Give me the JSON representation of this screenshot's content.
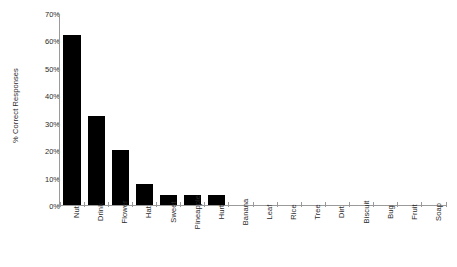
{
  "chart_data": {
    "type": "bar",
    "title": "",
    "subtitle": "",
    "xlabel": "",
    "ylabel": "% Correct Responses",
    "ylim": [
      0,
      70
    ],
    "ytick_labels": [
      "0%",
      "10%",
      "20%",
      "30%",
      "40%",
      "50%",
      "60%",
      "70%"
    ],
    "ytick_values": [
      0,
      10,
      20,
      30,
      40,
      50,
      60,
      70
    ],
    "grid": false,
    "legend": null,
    "bar_color": "#000000",
    "axis_color": "#9a9a9a",
    "background_color": "#ffffff",
    "categories": [
      "Nut",
      "Drink",
      "Flower",
      "Hat",
      "Sweet",
      "Pineapple",
      "Hurt",
      "Banana",
      "Leaf",
      "Rice",
      "Tree",
      "Dirt",
      "Biscuit",
      "Bug",
      "Fruit",
      "Soap"
    ],
    "values": [
      62.5,
      33,
      20.5,
      8,
      4,
      4,
      4,
      0,
      0,
      0,
      0,
      0,
      0,
      0,
      0,
      0
    ]
  }
}
